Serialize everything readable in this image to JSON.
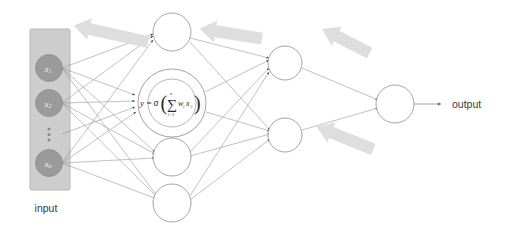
{
  "diagram": {
    "input_panel": {
      "label": "input",
      "nodes": [
        {
          "base": "x",
          "sub": "1"
        },
        {
          "base": "x",
          "sub": "2"
        },
        {
          "base": "x",
          "sub": "n"
        }
      ],
      "ellipsis": "⋮"
    },
    "formula": {
      "y": "y",
      "equals": "=",
      "sigma_fn": "σ",
      "paren_open": "(",
      "sum": "∑",
      "sum_upper": "n",
      "sum_lower": "i=1",
      "term_w": "w",
      "term_w_sub": "i",
      "term_x": "x",
      "term_x_sub": "i",
      "paren_close": ")"
    },
    "output": {
      "label": "output"
    },
    "colors": {
      "panel_fill": "#cdcdcd",
      "panel_stroke": "#b3b3b3",
      "node_fill": "#9a9a9a",
      "node_stroke": "#8a8a8a",
      "circle_stroke": "#8d8d8d",
      "edge_stroke": "#8f8f8f",
      "arrow_fill": "#dcdcdc",
      "text": "#3a3a3a"
    }
  }
}
